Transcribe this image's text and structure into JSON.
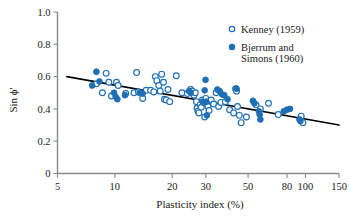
{
  "chart_data": {
    "type": "scatter",
    "title": "",
    "xlabel": "Plasticity index (%)",
    "ylabel": "Sin ϕ'",
    "xscale": "log",
    "yscale": "linear",
    "xlim": [
      5,
      150
    ],
    "ylim": [
      0,
      1.0
    ],
    "grid": false,
    "legend_position": "top-right",
    "xticks": [
      5,
      10,
      20,
      30,
      50,
      80,
      100,
      150
    ],
    "xtick_labels": [
      "5",
      "10",
      "20",
      "30",
      "50",
      "80",
      "100",
      "150"
    ],
    "yticks": [
      0,
      0.2,
      0.4,
      0.6,
      0.8,
      1.0
    ],
    "ytick_labels": [
      "0",
      "0.2",
      "0.4",
      "0.6",
      "0.8",
      "1.0"
    ],
    "series": [
      {
        "name": "Kenney (1959)",
        "marker": "open-circle",
        "color": "#1f6fb5",
        "points": [
          [
            8.0,
            0.555
          ],
          [
            8.6,
            0.5
          ],
          [
            9.0,
            0.62
          ],
          [
            9.3,
            0.565
          ],
          [
            9.6,
            0.48
          ],
          [
            10.2,
            0.565
          ],
          [
            10.4,
            0.545
          ],
          [
            11.4,
            0.495
          ],
          [
            12.6,
            0.5
          ],
          [
            13.0,
            0.625
          ],
          [
            13.3,
            0.505
          ],
          [
            14.0,
            0.465
          ],
          [
            14.6,
            0.515
          ],
          [
            15.4,
            0.515
          ],
          [
            16.0,
            0.505
          ],
          [
            16.3,
            0.6
          ],
          [
            16.6,
            0.575
          ],
          [
            17.0,
            0.545
          ],
          [
            17.3,
            0.51
          ],
          [
            17.6,
            0.615
          ],
          [
            18.0,
            0.565
          ],
          [
            18.2,
            0.46
          ],
          [
            18.6,
            0.455
          ],
          [
            19.0,
            0.52
          ],
          [
            19.4,
            0.445
          ],
          [
            21.0,
            0.605
          ],
          [
            22.5,
            0.5
          ],
          [
            24.0,
            0.495
          ],
          [
            25.0,
            0.52
          ],
          [
            25.5,
            0.51
          ],
          [
            26.0,
            0.485
          ],
          [
            26.4,
            0.5
          ],
          [
            26.8,
            0.445
          ],
          [
            27.0,
            0.405
          ],
          [
            27.3,
            0.385
          ],
          [
            27.6,
            0.375
          ],
          [
            28.0,
            0.425
          ],
          [
            28.4,
            0.41
          ],
          [
            28.8,
            0.455
          ],
          [
            29.2,
            0.44
          ],
          [
            29.6,
            0.35
          ],
          [
            30.0,
            0.465
          ],
          [
            30.4,
            0.44
          ],
          [
            30.8,
            0.415
          ],
          [
            31.2,
            0.39
          ],
          [
            32.0,
            0.455
          ],
          [
            33.0,
            0.43
          ],
          [
            34.0,
            0.5
          ],
          [
            35.0,
            0.415
          ],
          [
            36.0,
            0.44
          ],
          [
            38.0,
            0.445
          ],
          [
            40.0,
            0.395
          ],
          [
            42.0,
            0.375
          ],
          [
            43.0,
            0.525
          ],
          [
            43.5,
            0.51
          ],
          [
            44.0,
            0.415
          ],
          [
            45.0,
            0.36
          ],
          [
            46.0,
            0.315
          ],
          [
            49.0,
            0.35
          ],
          [
            55.0,
            0.425
          ],
          [
            58.0,
            0.4
          ],
          [
            64.0,
            0.435
          ],
          [
            72.0,
            0.365
          ],
          [
            95.0,
            0.355
          ],
          [
            97.0,
            0.315
          ]
        ]
      },
      {
        "name": "Bjerrum and Simons (1960)",
        "marker": "filled-circle",
        "color": "#1f6fb5",
        "points": [
          [
            7.6,
            0.545
          ],
          [
            8.0,
            0.63
          ],
          [
            8.3,
            0.57
          ],
          [
            9.9,
            0.5
          ],
          [
            10.1,
            0.475
          ],
          [
            10.3,
            0.46
          ],
          [
            11.3,
            0.485
          ],
          [
            13.5,
            0.5
          ],
          [
            14.0,
            0.495
          ],
          [
            24.5,
            0.51
          ],
          [
            25.0,
            0.5
          ],
          [
            28.9,
            0.445
          ],
          [
            29.6,
            0.515
          ],
          [
            29.9,
            0.58
          ],
          [
            30.2,
            0.445
          ],
          [
            30.4,
            0.36
          ],
          [
            34.5,
            0.52
          ],
          [
            35.5,
            0.51
          ],
          [
            36.5,
            0.49
          ],
          [
            37.5,
            0.485
          ],
          [
            39.0,
            0.46
          ],
          [
            43.5,
            0.525
          ],
          [
            53.0,
            0.45
          ],
          [
            54.0,
            0.435
          ],
          [
            57.0,
            0.385
          ],
          [
            57.5,
            0.365
          ],
          [
            58.0,
            0.335
          ],
          [
            77.0,
            0.385
          ],
          [
            80.0,
            0.395
          ],
          [
            83.0,
            0.4
          ],
          [
            93.0,
            0.335
          ],
          [
            94.0,
            0.325
          ]
        ]
      }
    ],
    "trend_line": {
      "name": "best-fit-line",
      "color": "#000000",
      "points": [
        [
          5.6,
          0.6
        ],
        [
          150,
          0.3
        ]
      ]
    }
  },
  "legend": {
    "entries": [
      {
        "label": "Kenney (1959)",
        "marker": "open-circle"
      },
      {
        "label": "Bjerrum and",
        "label2": "Simons (1960)",
        "marker": "filled-circle"
      }
    ]
  },
  "caption": {
    "text": ""
  }
}
